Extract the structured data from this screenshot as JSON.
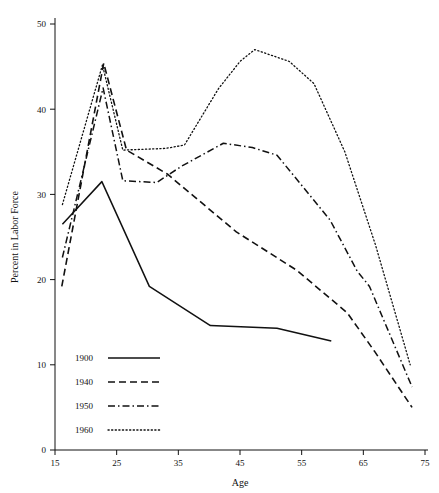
{
  "chart_data": {
    "type": "line",
    "title": "",
    "xlabel": "Age",
    "ylabel": "Percent in Labor Force",
    "xlim": [
      15,
      75
    ],
    "ylim": [
      0,
      50
    ],
    "xticks": [
      15,
      25,
      35,
      45,
      55,
      65,
      75
    ],
    "yticks": [
      0,
      10,
      20,
      30,
      40,
      50
    ],
    "grid": false,
    "legend_position": "lower-left",
    "series": [
      {
        "name": "1900",
        "style": "solid",
        "points": [
          [
            16.2,
            26.5
          ],
          [
            22.6,
            31.5
          ],
          [
            30.3,
            19.2
          ],
          [
            40.2,
            14.6
          ],
          [
            51.0,
            14.3
          ],
          [
            59.8,
            12.8
          ]
        ]
      },
      {
        "name": "1940",
        "style": "dashed",
        "points": [
          [
            16.1,
            19.2
          ],
          [
            22.9,
            45.4
          ],
          [
            26.6,
            35.2
          ],
          [
            33.2,
            32.4
          ],
          [
            44.4,
            25.6
          ],
          [
            54.2,
            21.1
          ],
          [
            62.4,
            16.1
          ],
          [
            66.8,
            11.6
          ],
          [
            72.9,
            5.0
          ]
        ]
      },
      {
        "name": "1950",
        "style": "dashdot",
        "points": [
          [
            16.2,
            22.6
          ],
          [
            22.8,
            42.5
          ],
          [
            26.0,
            31.6
          ],
          [
            31.5,
            31.4
          ],
          [
            35.5,
            33.3
          ],
          [
            42.3,
            36.0
          ],
          [
            47.0,
            35.5
          ],
          [
            51.0,
            34.6
          ],
          [
            59.6,
            27.0
          ],
          [
            64.0,
            21.0
          ],
          [
            66.0,
            19.2
          ],
          [
            72.9,
            7.4
          ]
        ]
      },
      {
        "name": "1960",
        "style": "dotted",
        "points": [
          [
            16.2,
            28.8
          ],
          [
            22.7,
            45.2
          ],
          [
            26.0,
            35.2
          ],
          [
            33.0,
            35.4
          ],
          [
            36.0,
            35.8
          ],
          [
            41.5,
            42.4
          ],
          [
            45.0,
            45.6
          ],
          [
            47.4,
            47.0
          ],
          [
            53.0,
            45.6
          ],
          [
            57.0,
            43.0
          ],
          [
            62.0,
            35.0
          ],
          [
            67.0,
            24.0
          ],
          [
            72.6,
            10.0
          ]
        ]
      }
    ]
  },
  "legend": {
    "entries": [
      {
        "label": "1900",
        "style": "solid"
      },
      {
        "label": "1940",
        "style": "dashed"
      },
      {
        "label": "1950",
        "style": "dashdot"
      },
      {
        "label": "1960",
        "style": "dotted"
      }
    ]
  },
  "colors": {
    "ink": "#111111",
    "background": "#ffffff"
  }
}
